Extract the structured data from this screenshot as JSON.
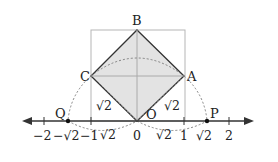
{
  "diagram": {
    "points": {
      "A": "A",
      "B": "B",
      "C": "C",
      "O": "O",
      "P": "P",
      "Q": "Q"
    },
    "segment_labels": {
      "OC": "√2",
      "OA": "√2",
      "arc_left": "√2",
      "arc_right": "√2"
    },
    "number_line": {
      "ticks": [
        {
          "value": -2,
          "label": "−2"
        },
        {
          "value": -1.414,
          "label": "−√2"
        },
        {
          "value": -1,
          "label": "−1"
        },
        {
          "value": 0,
          "label": "0"
        },
        {
          "value": 1,
          "label": "1"
        },
        {
          "value": 1.414,
          "label": "√2"
        },
        {
          "value": 2,
          "label": "2"
        }
      ]
    },
    "colors": {
      "square_fill": "#e3e3e3",
      "square_stroke": "#333333",
      "box_stroke": "#b5b5b5",
      "axis": "#333333",
      "dotted": "#777777"
    }
  }
}
